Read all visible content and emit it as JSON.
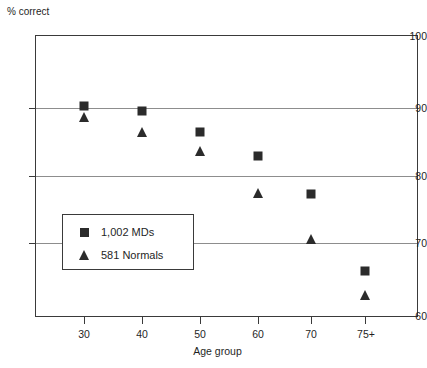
{
  "chart_data": {
    "type": "scatter",
    "title": "",
    "xlabel": "Age group",
    "ylabel": "% correct",
    "categories": [
      "30",
      "40",
      "50",
      "60",
      "70",
      "75+"
    ],
    "ylim": [
      60,
      100
    ],
    "yticks": [
      60,
      70,
      80,
      90,
      100
    ],
    "grid": "horizontal gridlines at 70, 80, 90",
    "legend_position": "inside lower-left",
    "series": [
      {
        "name": "1,002 MDs",
        "marker": "square",
        "color": "#2b2b2b",
        "values": [
          90.0,
          89.2,
          86.3,
          82.9,
          77.4,
          66.5
        ]
      },
      {
        "name": "581 Normals",
        "marker": "triangle",
        "color": "#2b2b2b",
        "values": [
          88.3,
          86.3,
          83.6,
          77.6,
          71.0,
          63.1
        ]
      }
    ]
  },
  "axes": {
    "y_label_text": "% correct",
    "x_label_text": "Age group",
    "y_ticks": [
      {
        "label": "100",
        "value": 100
      },
      {
        "label": "90",
        "value": 90
      },
      {
        "label": "80",
        "value": 80
      },
      {
        "label": "70",
        "value": 70
      },
      {
        "label": "60",
        "value": 60
      }
    ],
    "x_ticks": [
      {
        "label": "30"
      },
      {
        "label": "40"
      },
      {
        "label": "50"
      },
      {
        "label": "60"
      },
      {
        "label": "70"
      },
      {
        "label": "75+"
      }
    ]
  },
  "legend": {
    "entries": [
      {
        "label": "1,002 MDs",
        "marker": "square-marker-icon"
      },
      {
        "label": "581 Normals",
        "marker": "triangle-marker-icon"
      }
    ]
  },
  "colors": {
    "marker": "#2b2b2b",
    "frame": "#3a3a3a",
    "gridline": "#8d8d8d",
    "text": "#1f1f1f",
    "background": "#ffffff"
  }
}
